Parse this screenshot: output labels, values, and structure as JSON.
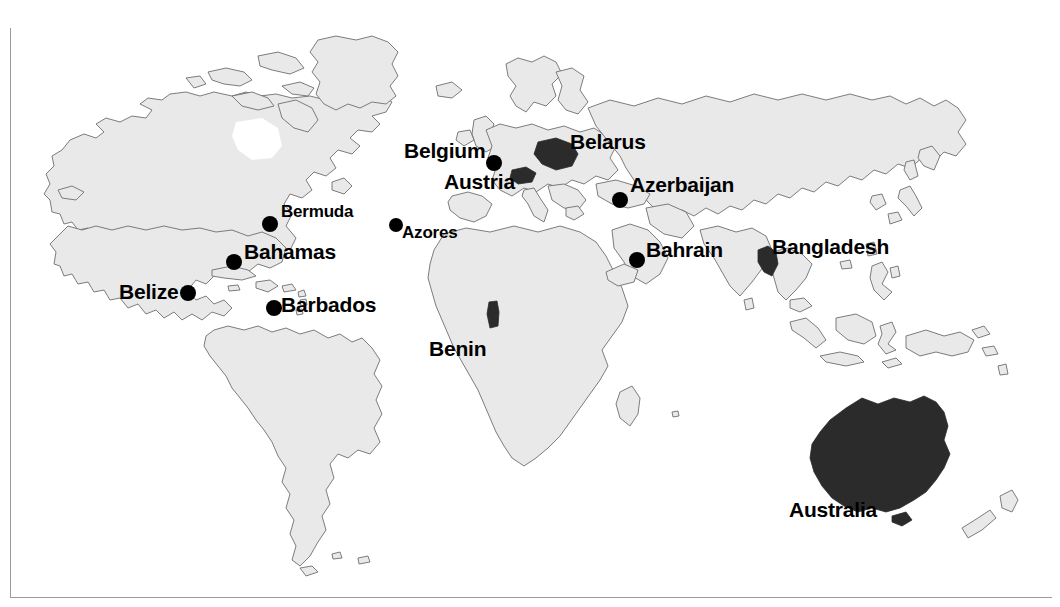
{
  "map": {
    "title": "World map showing countries beginning with the letter B and A",
    "colors": {
      "ocean": "#ffffff",
      "land_fill": "#e9e9e9",
      "land_stroke": "#6e6e6e",
      "highlight_fill": "#2b2b2b",
      "marker": "#000000",
      "frame": "#9a9a9a",
      "label_text": "#000000"
    },
    "projection": "equirectangular",
    "background": "white"
  },
  "labels": [
    {
      "id": "belgium",
      "text": "Belgium",
      "x": 404,
      "y": 140,
      "weight": "bold"
    },
    {
      "id": "belarus",
      "text": "Belarus",
      "x": 570,
      "y": 131,
      "weight": "bold"
    },
    {
      "id": "austria",
      "text": "Austria",
      "x": 444,
      "y": 171,
      "weight": "bold"
    },
    {
      "id": "azerbaijan",
      "text": "Azerbaijan",
      "x": 630,
      "y": 174,
      "weight": "bold"
    },
    {
      "id": "bermuda",
      "text": "Bermuda",
      "x": 281,
      "y": 203,
      "weight": "plain"
    },
    {
      "id": "azores",
      "text": "Azores",
      "x": 402,
      "y": 224,
      "weight": "plain"
    },
    {
      "id": "bahamas",
      "text": "Bahamas",
      "x": 244,
      "y": 241,
      "weight": "bold"
    },
    {
      "id": "bahrain",
      "text": "Bahrain",
      "x": 646,
      "y": 239,
      "weight": "bold"
    },
    {
      "id": "bangladesh",
      "text": "Bangladesh",
      "x": 772,
      "y": 236,
      "weight": "bold"
    },
    {
      "id": "belize",
      "text": "Belize",
      "x": 119,
      "y": 281,
      "weight": "bold"
    },
    {
      "id": "barbados",
      "text": "Barbados",
      "x": 281,
      "y": 294,
      "weight": "bold"
    },
    {
      "id": "benin",
      "text": "Benin",
      "x": 429,
      "y": 338,
      "weight": "bold"
    },
    {
      "id": "australia",
      "text": "Australia",
      "x": 789,
      "y": 499,
      "weight": "bold"
    }
  ],
  "markers": [
    {
      "id": "bermuda",
      "name": "Bermuda",
      "x": 270,
      "y": 224,
      "r": 8
    },
    {
      "id": "bahamas",
      "name": "Bahamas",
      "x": 234,
      "y": 262,
      "r": 8
    },
    {
      "id": "belize",
      "name": "Belize",
      "x": 188,
      "y": 293,
      "r": 8
    },
    {
      "id": "barbados",
      "name": "Barbados",
      "x": 274,
      "y": 308,
      "r": 8
    },
    {
      "id": "azores",
      "name": "Azores",
      "x": 396,
      "y": 225,
      "r": 7
    },
    {
      "id": "belgium",
      "name": "Belgium",
      "x": 494,
      "y": 163,
      "r": 8
    },
    {
      "id": "azerbaijan",
      "name": "Azerbaijan",
      "x": 620,
      "y": 200,
      "r": 8
    },
    {
      "id": "bahrain",
      "name": "Bahrain",
      "x": 637,
      "y": 260,
      "r": 8
    }
  ],
  "highlighted_countries": [
    {
      "id": "australia",
      "name": "Australia"
    },
    {
      "id": "belarus",
      "name": "Belarus"
    },
    {
      "id": "austria",
      "name": "Austria"
    },
    {
      "id": "bangladesh",
      "name": "Bangladesh"
    },
    {
      "id": "benin",
      "name": "Benin"
    }
  ]
}
